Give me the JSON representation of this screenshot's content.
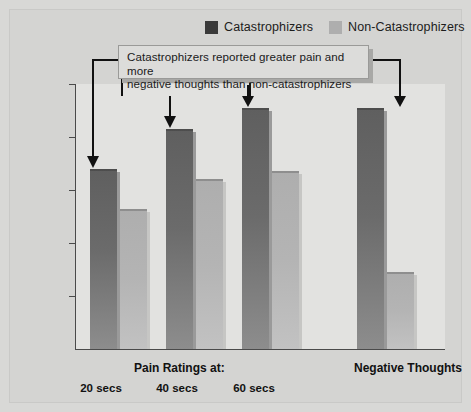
{
  "figure": {
    "background_color": "#d8d8d6",
    "plot_background_color": "#e2e2e0"
  },
  "legend": {
    "position": "top-right",
    "entries": [
      {
        "label": "Catastrophizers",
        "color": "#3a3a3a",
        "icon": "legend-swatch-icon"
      },
      {
        "label": "Non-Catastrophizers",
        "color": "#aeaeae",
        "icon": "legend-swatch-icon"
      }
    ]
  },
  "annotation": {
    "text": "Catastrophizers reported greater pain and more negative thoughts than non-catastrophizers",
    "line1": "Catastrophizers reported greater pain and more",
    "line2": "negative thoughts than non-catastrophizers",
    "arrow_icon": "down-arrow-icon",
    "targets": [
      "20 secs",
      "40 secs",
      "60 secs",
      "Negative Thoughts"
    ]
  },
  "axes": {
    "y_title": "Ratings of Pain and Negative Thoughts",
    "y_ticks": [
      10,
      8,
      6,
      4,
      2,
      0
    ],
    "y_min": 0,
    "y_max": 10,
    "x_group_titles": [
      {
        "label": "Pain Ratings at:"
      },
      {
        "label": "Negative Thoughts"
      }
    ],
    "x_tick_labels": [
      "20 secs",
      "40 secs",
      "60 secs"
    ]
  },
  "chart_data": {
    "type": "bar",
    "title": "",
    "subtitle": "",
    "xlabel": "",
    "ylabel": "Ratings of Pain and Negative Thoughts",
    "ylim": [
      0,
      10
    ],
    "yticks": [
      0,
      2,
      4,
      6,
      8,
      10
    ],
    "grid": false,
    "legend_position": "top-right",
    "categories": [
      "20 secs",
      "40 secs",
      "60 secs",
      "Negative Thoughts"
    ],
    "category_groups": [
      {
        "title": "Pain Ratings at:",
        "categories": [
          "20 secs",
          "40 secs",
          "60 secs"
        ]
      },
      {
        "title": "Negative Thoughts",
        "categories": [
          "Negative Thoughts"
        ]
      }
    ],
    "series": [
      {
        "name": "Catastrophizers",
        "color": "#6b6b6b",
        "values": [
          6.8,
          8.3,
          9.1,
          9.1
        ]
      },
      {
        "name": "Non-Catastrophizers",
        "color": "#b4b4b4",
        "values": [
          5.3,
          6.4,
          6.7,
          2.9
        ]
      }
    ],
    "annotations": [
      {
        "text": "Catastrophizers reported greater pain and more negative thoughts than non-catastrophizers",
        "points_to": [
          "20 secs",
          "40 secs",
          "60 secs",
          "Negative Thoughts"
        ]
      }
    ]
  }
}
